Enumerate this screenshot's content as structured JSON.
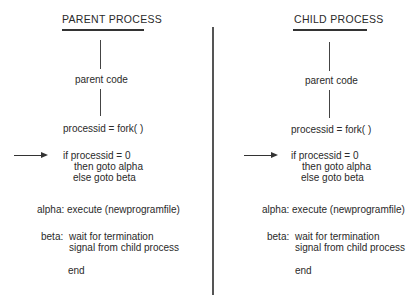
{
  "diagram": {
    "type": "process-fork-illustration",
    "columns": [
      {
        "id": "parent",
        "header": "PARENT PROCESS",
        "code_label": "parent code",
        "fork_line": "processid = fork( )",
        "if_line": "if processid = 0",
        "then_line": "then goto alpha",
        "else_line": "else goto beta",
        "alpha_line": "alpha: execute (newprogramfile)",
        "beta_label": "beta:",
        "beta_line1": "wait for termination",
        "beta_line2": "signal from child process",
        "end_line": "end",
        "arrow_points_to": "if processid = 0"
      },
      {
        "id": "child",
        "header": "CHILD PROCESS",
        "code_label": "parent code",
        "fork_line": "processid = fork( )",
        "if_line": "if processid = 0",
        "then_line": "then goto alpha",
        "else_line": "else goto beta",
        "alpha_line": "alpha: execute (newprogramfile)",
        "beta_label": "beta:",
        "beta_line1": "wait for termination",
        "beta_line2": "signal from child process",
        "end_line": "end",
        "arrow_points_to": "if processid = 0"
      }
    ],
    "colors": {
      "text": "#2a2a2a",
      "lines": "#444444",
      "background": "#ffffff"
    }
  }
}
